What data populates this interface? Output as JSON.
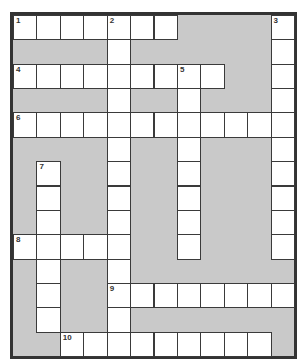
{
  "puzzle": {
    "type": "crossword",
    "columns": 12,
    "rows": 14,
    "colors": {
      "block": "#c9c9c9",
      "cell": "#ffffff",
      "border": "#333333"
    },
    "entries": [
      {
        "number": "1",
        "direction": "across",
        "row": 0,
        "col": 0,
        "length": 7
      },
      {
        "number": "2",
        "direction": "down",
        "row": 0,
        "col": 4,
        "length": 14
      },
      {
        "number": "3",
        "direction": "down",
        "row": 0,
        "col": 11,
        "length": 10
      },
      {
        "number": "4",
        "direction": "across",
        "row": 2,
        "col": 0,
        "length": 9
      },
      {
        "number": "5",
        "direction": "down",
        "row": 2,
        "col": 7,
        "length": 8
      },
      {
        "number": "6",
        "direction": "across",
        "row": 4,
        "col": 0,
        "length": 12
      },
      {
        "number": "7",
        "direction": "down",
        "row": 6,
        "col": 1,
        "length": 7
      },
      {
        "number": "8",
        "direction": "across",
        "row": 9,
        "col": 0,
        "length": 5
      },
      {
        "number": "9",
        "direction": "across",
        "row": 11,
        "col": 4,
        "length": 8
      },
      {
        "number": "10",
        "direction": "across",
        "row": 13,
        "col": 2,
        "length": 9
      }
    ]
  }
}
